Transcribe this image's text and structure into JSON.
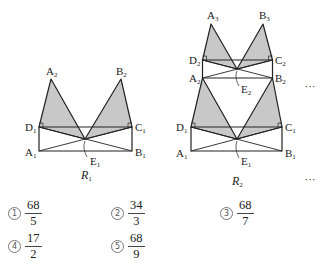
{
  "figures": [
    {
      "name": "R1",
      "caption": "R",
      "caption_sub": "1",
      "caption_pos": [
        81,
        179
      ],
      "levels": [
        {
          "rect": {
            "D": [
              39,
              127
            ],
            "C": [
              132,
              127
            ],
            "A": [
              39,
              151
            ],
            "B": [
              132,
              151
            ]
          },
          "E": [
            85,
            139
          ],
          "apexL": [
            51,
            79
          ],
          "apexR": [
            121,
            79
          ]
        }
      ],
      "labels": [
        {
          "t": "A",
          "s": "2",
          "x": 46,
          "y": 75
        },
        {
          "t": "B",
          "s": "2",
          "x": 116,
          "y": 75
        },
        {
          "t": "D",
          "s": "1",
          "x": 25,
          "y": 131
        },
        {
          "t": "C",
          "s": "1",
          "x": 135,
          "y": 131
        },
        {
          "t": "A",
          "s": "1",
          "x": 25,
          "y": 156
        },
        {
          "t": "B",
          "s": "1",
          "x": 135,
          "y": 156
        },
        {
          "t": "E",
          "s": "1",
          "x": 90,
          "y": 165
        }
      ],
      "e_leaders": [
        [
          [
            85,
            139
          ],
          [
            87,
            157
          ]
        ]
      ]
    },
    {
      "name": "R2",
      "caption": "R",
      "caption_sub": "2",
      "caption_pos": [
        232,
        185
      ],
      "levels": [
        {
          "rect": {
            "D": [
              191,
              127
            ],
            "C": [
              282,
              127
            ],
            "A": [
              191,
              151
            ],
            "B": [
              282,
              151
            ]
          },
          "E": [
            237,
            139
          ],
          "apexL": [
            202.5,
            78
          ],
          "apexR": [
            272.5,
            78
          ]
        },
        {
          "rect": {
            "D": [
              202.5,
              60
            ],
            "C": [
              272.5,
              60
            ],
            "A": [
              202.5,
              78
            ],
            "B": [
              272.5,
              78
            ]
          },
          "E": [
            237,
            69
          ],
          "apexL": [
            211,
            24
          ],
          "apexR": [
            263,
            24
          ]
        }
      ],
      "labels": [
        {
          "t": "A",
          "s": "3",
          "x": 207,
          "y": 19
        },
        {
          "t": "B",
          "s": "3",
          "x": 259,
          "y": 19
        },
        {
          "t": "D",
          "s": "2",
          "x": 189,
          "y": 64
        },
        {
          "t": "C",
          "s": "2",
          "x": 275,
          "y": 64
        },
        {
          "t": "A",
          "s": "2",
          "x": 189,
          "y": 82
        },
        {
          "t": "B",
          "s": "2",
          "x": 275,
          "y": 82
        },
        {
          "t": "E",
          "s": "2",
          "x": 241,
          "y": 93
        },
        {
          "t": "D",
          "s": "1",
          "x": 176,
          "y": 131
        },
        {
          "t": "C",
          "s": "1",
          "x": 285,
          "y": 131
        },
        {
          "t": "A",
          "s": "1",
          "x": 176,
          "y": 157
        },
        {
          "t": "B",
          "s": "1",
          "x": 285,
          "y": 157
        },
        {
          "t": "E",
          "s": "1",
          "x": 241,
          "y": 165
        }
      ],
      "e_leaders": [
        [
          [
            237,
            69
          ],
          [
            239,
            86
          ]
        ],
        [
          [
            237,
            139
          ],
          [
            239,
            158
          ]
        ]
      ]
    }
  ],
  "ellipses": [
    {
      "text": "···",
      "x": 310,
      "y": 90
    },
    {
      "text": "···",
      "x": 310,
      "y": 183
    }
  ],
  "colors": {
    "shade": "#c8c8c8",
    "stroke": "#222222"
  },
  "choices": [
    {
      "mark": "1",
      "num": "68",
      "den": "5",
      "x": 8,
      "y": 199
    },
    {
      "mark": "2",
      "num": "34",
      "den": "3",
      "x": 111,
      "y": 199
    },
    {
      "mark": "3",
      "num": "68",
      "den": "7",
      "x": 220,
      "y": 199
    },
    {
      "mark": "4",
      "num": "17",
      "den": "2",
      "x": 8,
      "y": 232
    },
    {
      "mark": "5",
      "num": "68",
      "den": "9",
      "x": 111,
      "y": 232
    }
  ]
}
